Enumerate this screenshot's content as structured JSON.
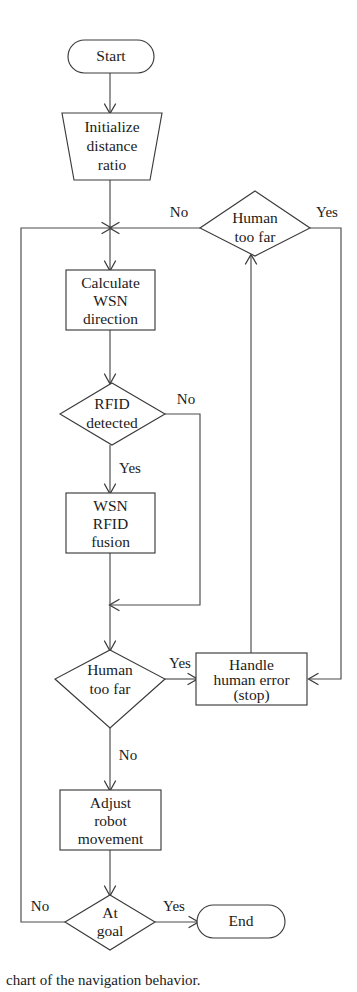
{
  "diagram": {
    "colors": {
      "background": "#ffffff",
      "stroke": "#3b3b3b",
      "connector": "#4a4a4a",
      "text": "#1b1b1b"
    },
    "nodes": {
      "start": {
        "label": "Start",
        "shape": "terminator"
      },
      "initialize": {
        "line1": "Initialize",
        "line2": "distance",
        "line3": "ratio",
        "shape": "trapezoid"
      },
      "human_too_far_1": {
        "line1": "Human",
        "line2": "too far",
        "shape": "decision"
      },
      "calculate_wsn": {
        "line1": "Calculate",
        "line2": "WSN",
        "line3": "direction",
        "shape": "process"
      },
      "rfid_detected": {
        "line1": "RFID",
        "line2": "detected",
        "shape": "decision"
      },
      "wsn_rfid_fusion": {
        "line1": "WSN",
        "line2": "RFID",
        "line3": "fusion",
        "shape": "process"
      },
      "human_too_far_2": {
        "line1": "Human",
        "line2": "too far",
        "shape": "decision"
      },
      "handle_human_error": {
        "line1": "Handle",
        "line2": "human error",
        "line3": "(stop)",
        "shape": "process"
      },
      "adjust_robot": {
        "line1": "Adjust",
        "line2": "robot",
        "line3": "movement",
        "shape": "process"
      },
      "at_goal": {
        "line1": "At",
        "line2": "goal",
        "shape": "decision"
      },
      "end": {
        "label": "End",
        "shape": "terminator"
      }
    },
    "edge_labels": {
      "human_far_1_no": "No",
      "human_far_1_yes": "Yes",
      "rfid_no": "No",
      "rfid_yes": "Yes",
      "human_far_2_yes": "Yes",
      "human_far_2_no": "No",
      "at_goal_no": "No",
      "at_goal_yes": "Yes"
    },
    "caption": "chart of the navigation behavior."
  }
}
